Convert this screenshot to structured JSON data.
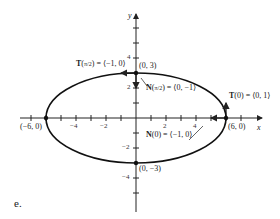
{
  "figure": {
    "part_label": "e.",
    "axes": {
      "x_label": "x",
      "y_label": "y"
    },
    "x_ticks": [
      "−4",
      "−2",
      "2",
      "4"
    ],
    "y_ticks": [
      "4",
      "2",
      "−2",
      "−4"
    ],
    "points": {
      "top": "(0, 3)",
      "bottom": "(0, −3)",
      "left": "(−6, 0)",
      "right": "(6, 0)"
    },
    "annotations": {
      "T_pi2": "T",
      "T_pi2_arg": "π/2",
      "T_pi2_val": "= ⟨−1, 0⟩",
      "N_pi2": "N",
      "N_pi2_arg": "π/2",
      "N_pi2_val": "= ⟨0, −1⟩",
      "T0": "T",
      "T0_rest": "(0) = ⟨0, 1⟩",
      "N0": "N",
      "N0_rest": "(0) = ⟨−1, 0⟩"
    },
    "curve": "ellipse x²/36 + y²/9 = 1"
  }
}
